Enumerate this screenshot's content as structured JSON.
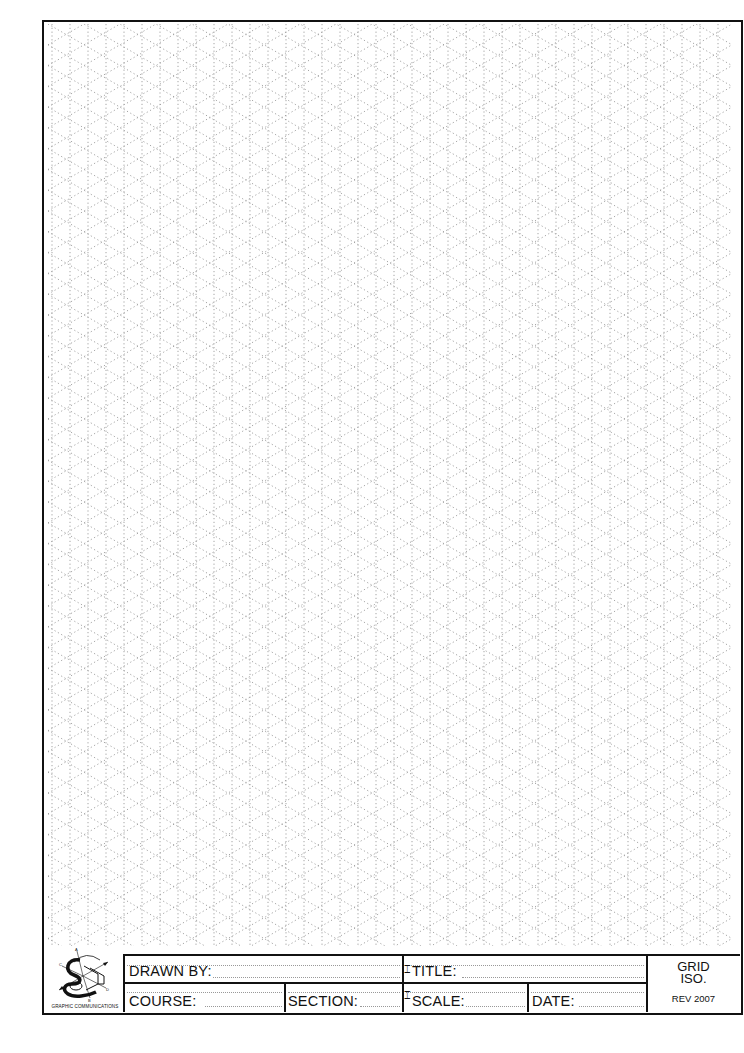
{
  "sheet": {
    "type": "isometric grid drawing sheet",
    "grid": {
      "pattern": "isometric",
      "line_style": "dotted",
      "line_color": "#9a9a9a",
      "vertical_spacing_px": 18,
      "diagonal_angle_deg": 30
    },
    "frame_color": "#111111"
  },
  "logo": {
    "icon": "graphic-communications-isometric-logo",
    "caption": "GRAPHIC COMMUNICATIONS"
  },
  "title_block": {
    "drawn_by_label": "DRAWN BY:",
    "drawn_by_value": "",
    "title_label": "TITLE:",
    "title_value": "",
    "course_label": "COURSE:",
    "course_value": "",
    "section_label": "SECTION:",
    "section_value": "",
    "scale_label": "SCALE:",
    "scale_value": "",
    "date_label": "DATE:",
    "date_value": "",
    "sheet_type_line1": "GRID",
    "sheet_type_line2": "ISO.",
    "revision": "REV 2007"
  }
}
